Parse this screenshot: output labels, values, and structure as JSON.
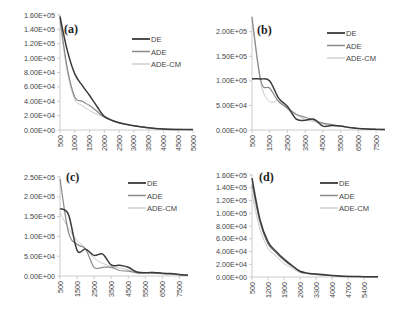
{
  "figure": {
    "series_styles": [
      {
        "name": "DE",
        "color": "#3a3a3a",
        "width": 1.5
      },
      {
        "name": "ADE",
        "color": "#8a8a8a",
        "width": 1.2
      },
      {
        "name": "ADE-CM",
        "color": "#c8c8c8",
        "width": 1.0
      }
    ]
  },
  "chart_data": [
    {
      "type": "line",
      "title": "(a)",
      "xlabel": "",
      "ylabel": "",
      "xlim": [
        500,
        5000
      ],
      "ylim": [
        0,
        160000
      ],
      "x_ticks": [
        "500",
        "1000",
        "1500",
        "2000",
        "2500",
        "3000",
        "3500",
        "4000",
        "4500",
        "5000"
      ],
      "y_ticks": [
        "0.00E+00",
        "2.00E+04",
        "4.00E+04",
        "6.00E+04",
        "8.00E+04",
        "1.00E+05",
        "1.20E+05",
        "1.40E+05",
        "1.60E+05"
      ],
      "legend": [
        "DE",
        "ADE",
        "ADE-CM"
      ],
      "legend_position": "upper right",
      "grid": false,
      "x": [
        500,
        750,
        1000,
        1250,
        1500,
        1750,
        2000,
        2500,
        3000,
        3500,
        4000,
        4500,
        5000
      ],
      "series": [
        {
          "name": "DE",
          "values": [
            158000,
            110000,
            78000,
            62000,
            48000,
            33000,
            19000,
            10000,
            6000,
            3000,
            1500,
            800,
            500
          ]
        },
        {
          "name": "ADE",
          "values": [
            155000,
            85000,
            46000,
            40000,
            34000,
            26000,
            18000,
            10000,
            6000,
            3000,
            1500,
            800,
            500
          ]
        },
        {
          "name": "ADE-CM",
          "values": [
            150000,
            80000,
            43000,
            34000,
            27000,
            22000,
            18000,
            10000,
            6000,
            3000,
            1500,
            800,
            500
          ]
        }
      ]
    },
    {
      "type": "line",
      "title": "(b)",
      "xlabel": "",
      "ylabel": "",
      "xlim": [
        500,
        8000
      ],
      "ylim": [
        0,
        230000
      ],
      "x_ticks": [
        "500",
        "1500",
        "2500",
        "3500",
        "4500",
        "5500",
        "6500",
        "7500"
      ],
      "y_ticks": [
        "0.00E+00",
        "5.00E+04",
        "1.00E+05",
        "1.50E+05",
        "2.00E+05"
      ],
      "legend": [
        "DE",
        "ADE",
        "ADE-CM"
      ],
      "legend_position": "upper right",
      "grid": false,
      "x": [
        500,
        1000,
        1500,
        2000,
        2500,
        3000,
        3500,
        4000,
        4500,
        5000,
        5500,
        6000,
        6500,
        7000,
        7500,
        8000
      ],
      "series": [
        {
          "name": "DE",
          "values": [
            104000,
            104000,
            100000,
            65000,
            48000,
            22000,
            20000,
            22000,
            8000,
            9000,
            8000,
            5000,
            3000,
            2000,
            1500,
            1000
          ]
        },
        {
          "name": "ADE",
          "values": [
            230000,
            100000,
            85000,
            58000,
            45000,
            32000,
            26000,
            20000,
            14000,
            11000,
            8000,
            5000,
            3000,
            2000,
            1500,
            1000
          ]
        },
        {
          "name": "ADE-CM",
          "values": [
            225000,
            95000,
            58000,
            60000,
            42000,
            30000,
            22000,
            17000,
            12000,
            10000,
            7000,
            5000,
            3000,
            2000,
            1500,
            1000
          ]
        }
      ]
    },
    {
      "type": "line",
      "title": "(c)",
      "xlabel": "",
      "ylabel": "",
      "xlim": [
        500,
        8000
      ],
      "ylim": [
        0,
        250000
      ],
      "x_ticks": [
        "500",
        "1500",
        "2500",
        "3500",
        "4500",
        "5500",
        "6500",
        "7500"
      ],
      "y_ticks": [
        "0.00E+00",
        "5.00E+04",
        "1.00E+05",
        "1.50E+05",
        "2.00E+05",
        "2.50E+05"
      ],
      "legend": [
        "DE",
        "ADE",
        "ADE-CM"
      ],
      "legend_position": "upper right",
      "grid": false,
      "x": [
        500,
        1000,
        1500,
        2000,
        2500,
        3000,
        3500,
        4000,
        4500,
        5000,
        5500,
        6000,
        6500,
        7000,
        7500,
        8000
      ],
      "series": [
        {
          "name": "DE",
          "values": [
            170000,
            155000,
            65000,
            68000,
            52000,
            55000,
            28000,
            27000,
            22000,
            10000,
            8000,
            9000,
            7000,
            6000,
            4000,
            2000
          ]
        },
        {
          "name": "ADE",
          "values": [
            245000,
            110000,
            80000,
            68000,
            22000,
            22000,
            22000,
            14000,
            12000,
            8000,
            8000,
            7000,
            6000,
            5000,
            3000,
            2000
          ]
        },
        {
          "name": "ADE-CM",
          "values": [
            160000,
            120000,
            90000,
            70000,
            45000,
            32000,
            24000,
            20000,
            16000,
            10000,
            9000,
            7000,
            6000,
            4000,
            3000,
            2000
          ]
        }
      ]
    },
    {
      "type": "line",
      "title": "(d)",
      "xlabel": "",
      "ylabel": "",
      "xlim": [
        500,
        6000
      ],
      "ylim": [
        0,
        160000
      ],
      "x_ticks": [
        "500",
        "1200",
        "1900",
        "2600",
        "3300",
        "4000",
        "4700",
        "5400"
      ],
      "y_ticks": [
        "0.00E+00",
        "2.00E+04",
        "4.00E+04",
        "6.00E+04",
        "8.00E+04",
        "1.00E+05",
        "1.20E+05",
        "1.40E+05",
        "1.60E+05"
      ],
      "legend": [
        "DE",
        "ADE",
        "ADE-CM"
      ],
      "legend_position": "upper right",
      "grid": false,
      "x": [
        500,
        850,
        1200,
        1550,
        1900,
        2250,
        2600,
        2950,
        3300,
        4000,
        4700,
        5400,
        6000
      ],
      "series": [
        {
          "name": "DE",
          "values": [
            155000,
            90000,
            55000,
            40000,
            28000,
            18000,
            9000,
            6000,
            4500,
            2500,
            1000,
            500,
            300
          ]
        },
        {
          "name": "ADE",
          "values": [
            145000,
            86000,
            52000,
            38000,
            26000,
            17000,
            8000,
            5500,
            4000,
            2200,
            900,
            400,
            300
          ]
        },
        {
          "name": "ADE-CM",
          "values": [
            130000,
            75000,
            45000,
            33000,
            21000,
            14000,
            7000,
            5000,
            3500,
            2000,
            800,
            400,
            300
          ]
        }
      ]
    }
  ],
  "panels_layout": [
    {
      "x0": 60,
      "y0": 130,
      "x1": 193,
      "y1": 15,
      "label_x": 64,
      "label_y": 33,
      "legend_x": 132,
      "legend_y": 39
    },
    {
      "x0": 252,
      "y0": 130,
      "x1": 385,
      "y1": 17,
      "label_x": 257,
      "label_y": 34,
      "legend_x": 327,
      "legend_y": 33
    },
    {
      "x0": 60,
      "y0": 276,
      "x1": 188,
      "y1": 177,
      "label_x": 66,
      "label_y": 181,
      "legend_x": 128,
      "legend_y": 183
    },
    {
      "x0": 252,
      "y0": 277,
      "x1": 378,
      "y1": 175,
      "label_x": 259,
      "label_y": 181,
      "legend_x": 320,
      "legend_y": 183
    }
  ]
}
